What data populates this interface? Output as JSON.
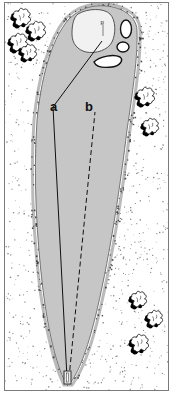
{
  "diagram": {
    "colors": {
      "fairway": "#c6c6c6",
      "fairway_edge": "#5a5a5a",
      "green": "#f1f1f1",
      "bunker": "#ffffff",
      "rough_stipple": "#2a2a2a",
      "tree_fill": "#ffffff",
      "tree_shadow": "#000000",
      "line": "#111111",
      "frame": "#7a7a7a"
    },
    "labels": {
      "pin": "p",
      "line_a": "a",
      "line_b": "b"
    },
    "elements": {
      "fairway": "fairway",
      "green": "green",
      "bunkers": [
        "bunker-1",
        "bunker-2",
        "bunker-3"
      ],
      "tee": "tee-box",
      "tree_groups": [
        "trees-top-left",
        "trees-right-middle",
        "trees-bottom-right"
      ]
    },
    "lines": [
      {
        "id": "a",
        "style": "solid",
        "label": "a"
      },
      {
        "id": "b",
        "style": "dashed",
        "label": "b"
      }
    ]
  }
}
